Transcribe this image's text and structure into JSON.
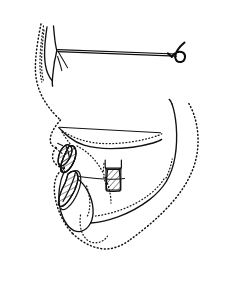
{
  "document": {
    "title": "Cephalometric Lateral Tracing",
    "type": "line-drawing",
    "background_color": "#ffffff",
    "ink_color": "#111111",
    "width_px": 229,
    "height_px": 299
  },
  "legend": {
    "hard_tissue_style": "solid line",
    "soft_tissue_style": "dotted line",
    "reference_line_style": "thin solid line",
    "tooth_fill_style": "diagonal hatching"
  },
  "structures": {
    "frontal_bone": "frontal-bone-outline",
    "nasion": "nasion-point",
    "orbital_floor": "orbital-floor-line",
    "sella_turcica": "sella-turcica-outline",
    "sn_line": "sella-nasion-reference-line",
    "nasal_bone": "nasal-bone-outline",
    "soft_tissue_profile": "soft-tissue-profile-outline",
    "maxilla": "maxilla-outline",
    "palatal_plane": "palatal-plane-line",
    "upper_incisor": "upper-incisor-tooth",
    "lower_incisor": "lower-incisor-tooth",
    "upper_molar": "upper-molar-tooth",
    "mandible": "mandible-outline",
    "mandibular_ramus": "mandibular-ramus-border",
    "gonial_angle": "gonial-angle",
    "symphysis": "mandibular-symphysis",
    "upper_lip": "upper-lip-contour",
    "lower_lip": "lower-lip-contour",
    "chin_soft_tissue": "soft-tissue-chin",
    "submental_contour": "submental-soft-tissue-contour",
    "posterior_neck": "posterior-soft-tissue-contour"
  },
  "annotations": {
    "none_visible": ""
  }
}
